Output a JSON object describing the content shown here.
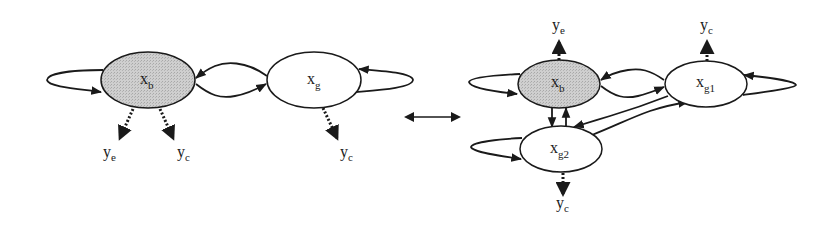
{
  "diagram": {
    "type": "state-transition-graph",
    "colors": {
      "shaded_node": "#c8c8c8",
      "stroke": "#1a1a1a",
      "background": "#ffffff"
    },
    "left_graph": {
      "nodes": [
        {
          "id": "xb",
          "base": "x",
          "sub": "b",
          "shaded": true
        },
        {
          "id": "xg",
          "base": "x",
          "sub": "g",
          "shaded": false
        }
      ],
      "edges": [
        {
          "from": "xb",
          "to": "xb",
          "kind": "self-loop"
        },
        {
          "from": "xg",
          "to": "xg",
          "kind": "self-loop"
        },
        {
          "from": "xb",
          "to": "xg",
          "kind": "transition"
        },
        {
          "from": "xg",
          "to": "xb",
          "kind": "transition"
        }
      ],
      "outputs": [
        {
          "from": "xb",
          "base": "y",
          "sub": "e",
          "style": "dotted"
        },
        {
          "from": "xb",
          "base": "y",
          "sub": "c",
          "style": "dotted"
        },
        {
          "from": "xg",
          "base": "y",
          "sub": "c",
          "style": "dotted"
        }
      ]
    },
    "equivalence_arrow": "double-headed arrow",
    "right_graph": {
      "nodes": [
        {
          "id": "xb",
          "base": "x",
          "sub": "b",
          "shaded": true
        },
        {
          "id": "xg1",
          "base": "x",
          "sub": "g1",
          "shaded": false
        },
        {
          "id": "xg2",
          "base": "x",
          "sub": "g2",
          "shaded": false
        }
      ],
      "edges": [
        {
          "from": "xb",
          "to": "xb",
          "kind": "self-loop"
        },
        {
          "from": "xg1",
          "to": "xg1",
          "kind": "self-loop"
        },
        {
          "from": "xg2",
          "to": "xg2",
          "kind": "self-loop"
        },
        {
          "from": "xb",
          "to": "xg1",
          "kind": "transition"
        },
        {
          "from": "xg1",
          "to": "xb",
          "kind": "transition"
        },
        {
          "from": "xb",
          "to": "xg2",
          "kind": "transition"
        },
        {
          "from": "xg2",
          "to": "xb",
          "kind": "transition"
        },
        {
          "from": "xg1",
          "to": "xg2",
          "kind": "transition"
        },
        {
          "from": "xg2",
          "to": "xg1",
          "kind": "transition"
        }
      ],
      "outputs": [
        {
          "from": "xb",
          "base": "y",
          "sub": "e",
          "style": "dotted"
        },
        {
          "from": "xg1",
          "base": "y",
          "sub": "c",
          "style": "dotted"
        },
        {
          "from": "xg2",
          "base": "y",
          "sub": "c",
          "style": "dotted"
        }
      ]
    }
  }
}
